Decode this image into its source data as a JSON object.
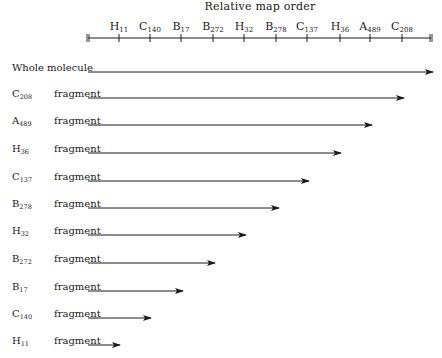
{
  "chart_data": {
    "type": "diagram",
    "title": "Relative map order",
    "axis": {
      "x_start": 88,
      "x_end": 431,
      "y": 38,
      "markers": [
        {
          "letter": "H",
          "sub": "11",
          "x": 119
        },
        {
          "letter": "C",
          "sub": "140",
          "x": 150
        },
        {
          "letter": "B",
          "sub": "17",
          "x": 181
        },
        {
          "letter": "B",
          "sub": "272",
          "x": 213
        },
        {
          "letter": "H",
          "sub": "32",
          "x": 244
        },
        {
          "letter": "B",
          "sub": "278",
          "x": 276
        },
        {
          "letter": "C",
          "sub": "137",
          "x": 307
        },
        {
          "letter": "H",
          "sub": "36",
          "x": 340
        },
        {
          "letter": "A",
          "sub": "489",
          "x": 370
        },
        {
          "letter": "C",
          "sub": "208",
          "x": 402
        }
      ]
    },
    "rows": [
      {
        "label": "Whole molecule",
        "letter": "",
        "sub": "",
        "suffix": "",
        "y": 72,
        "end_x": 433,
        "ends_at": "right end"
      },
      {
        "label": "C208 fragment",
        "letter": "C",
        "sub": "208",
        "suffix": "fragment",
        "y": 98,
        "end_x": 404,
        "ends_at": "C208"
      },
      {
        "label": "A489 fragment",
        "letter": "A",
        "sub": "489",
        "suffix": "fragment",
        "y": 125,
        "end_x": 372,
        "ends_at": "A489"
      },
      {
        "label": "H36 fragment",
        "letter": "H",
        "sub": "36",
        "suffix": "fragment",
        "y": 153,
        "end_x": 341,
        "ends_at": "H36"
      },
      {
        "label": "C137 fragment",
        "letter": "C",
        "sub": "137",
        "suffix": "fragment",
        "y": 181,
        "end_x": 309,
        "ends_at": "C137"
      },
      {
        "label": "B278 fragment",
        "letter": "B",
        "sub": "278",
        "suffix": "fragment",
        "y": 208,
        "end_x": 279,
        "ends_at": "B278"
      },
      {
        "label": "H32 fragment",
        "letter": "H",
        "sub": "32",
        "suffix": "fragment",
        "y": 235,
        "end_x": 246,
        "ends_at": "H32"
      },
      {
        "label": "B272 fragment",
        "letter": "B",
        "sub": "272",
        "suffix": "fragment",
        "y": 263,
        "end_x": 215,
        "ends_at": "B272"
      },
      {
        "label": "B17 fragment",
        "letter": "B",
        "sub": "17",
        "suffix": "fragment",
        "y": 291,
        "end_x": 183,
        "ends_at": "B17"
      },
      {
        "label": "C140 fragment",
        "letter": "C",
        "sub": "140",
        "suffix": "fragment",
        "y": 318,
        "end_x": 151,
        "ends_at": "C140"
      },
      {
        "label": "H11 fragment",
        "letter": "H",
        "sub": "11",
        "suffix": "fragment",
        "y": 345,
        "end_x": 120,
        "ends_at": "H11"
      }
    ],
    "arrow_start_x": 88
  },
  "title": "Relative map order",
  "whole_label": "Whole molecule",
  "fragment_word": "fragment"
}
